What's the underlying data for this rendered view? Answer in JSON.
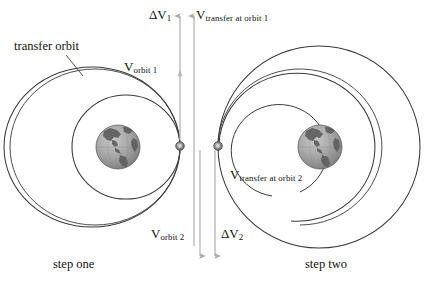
{
  "figure": {
    "background_color": "#ffffff",
    "orbit_stroke_color": "#3a3a3a",
    "arrow_color": "#a9a9a9",
    "text_color": "#111111",
    "spacecraft_dot_color": "#808080"
  },
  "labels": {
    "transfer_orbit": "transfer orbit",
    "delta_v1_main": "ΔV",
    "delta_v1_sub": "1",
    "v_transfer_orbit1_main": "V",
    "v_transfer_orbit1_sub": "transfer at orbit 1",
    "v_orbit1_main": "V",
    "v_orbit1_sub": "orbit 1",
    "v_transfer_orbit2_main": "V",
    "v_transfer_orbit2_sub": "transfer at orbit 2",
    "v_orbit2_main": "V",
    "v_orbit2_sub": "orbit 2",
    "delta_v2_main": "ΔV",
    "delta_v2_sub": "2"
  },
  "captions": {
    "step_one": "step one",
    "step_two": "step two"
  },
  "panels": {
    "left": {
      "name": "step one",
      "earth_center": [
        118,
        147
      ],
      "earth_radius": 22,
      "orbit1_radius": 52,
      "transfer_ellipse_rx": 88,
      "transfer_ellipse_ry": 80,
      "spacecraft_dot": [
        180,
        146
      ]
    },
    "right": {
      "name": "step two",
      "earth_center": [
        320,
        147
      ],
      "earth_radius": 22,
      "orbit2_radius": 101,
      "transfer_arc_rx": 78,
      "transfer_arc_ry": 72,
      "spacecraft_dot": [
        218,
        146
      ]
    }
  },
  "arrows": {
    "delta_v1": {
      "direction": "up",
      "x": 180,
      "y_tail": 148,
      "y_head": 14,
      "label": "ΔV1"
    },
    "v_transfer_at_1": {
      "direction": "up",
      "x": 194,
      "y_tail": 246,
      "y_head": 14,
      "label": "Vtransfer at orbit 1"
    },
    "v_orbit_1": {
      "direction": "up",
      "x": 180,
      "y_tail": 148,
      "y_head": 72,
      "label": "Vorbit 1"
    },
    "v_orbit_2": {
      "direction": "down",
      "x": 200,
      "y_tail": 148,
      "y_head": 258,
      "label": "Vorbit 2"
    },
    "delta_v2": {
      "direction": "down",
      "x": 215,
      "y_tail": 148,
      "y_head": 258,
      "label": "ΔV2"
    }
  }
}
